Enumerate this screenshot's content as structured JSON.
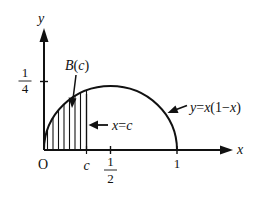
{
  "figure": {
    "type": "diagram",
    "colors": {
      "stroke": "#111111",
      "background": "#ffffff"
    },
    "axes": {
      "x_label": "x",
      "y_label": "y",
      "origin_label": "O",
      "x_ticks": [
        {
          "label": "c",
          "value": "c"
        },
        {
          "num": "1",
          "den": "2",
          "value": 0.5
        },
        {
          "label": "1",
          "value": 1
        }
      ],
      "y_ticks": [
        {
          "num": "1",
          "den": "4",
          "value": 0.25
        }
      ]
    },
    "curve": {
      "equation_label": "y=x(1−x)",
      "equation_parts": {
        "y": "y",
        "eq": "=",
        "x1": "x",
        "paren_open": "(1−",
        "x2": "x",
        "paren_close": ")"
      }
    },
    "region": {
      "label": "B(c)",
      "label_parts": {
        "B": "B",
        "open": "(",
        "c": "c",
        "close": ")"
      },
      "boundary_label": "x=c",
      "boundary_parts": {
        "x": "x",
        "eq": "=",
        "c": "c"
      }
    }
  }
}
